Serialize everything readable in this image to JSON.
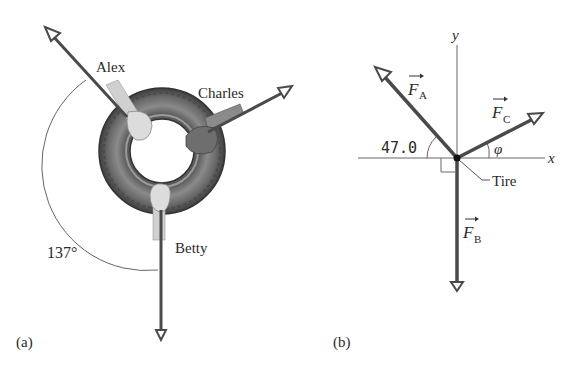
{
  "panel_a": {
    "label": "(a)",
    "people": {
      "alex": "Alex",
      "charles": "Charles",
      "betty": "Betty"
    },
    "angle_label": "137°"
  },
  "panel_b": {
    "label": "(b)",
    "axis_x": "x",
    "axis_y": "y",
    "force_a": {
      "symbol": "F",
      "subscript": "A"
    },
    "force_b": {
      "symbol": "F",
      "subscript": "B"
    },
    "force_c": {
      "symbol": "F",
      "subscript": "C"
    },
    "angle_a_label": "47.0",
    "angle_c_label": "φ",
    "tire_label": "Tire"
  },
  "colors": {
    "arrow": "#4a4a4a",
    "arrow_head_fill": "#ffffff",
    "tire_dark": "#4d4d4d",
    "tire_mid": "#7a7a7a",
    "hand_light": "#d9d9d9",
    "hand_dark": "#6a6a6a",
    "text": "#2a2a2a",
    "thin_line": "#555555"
  }
}
